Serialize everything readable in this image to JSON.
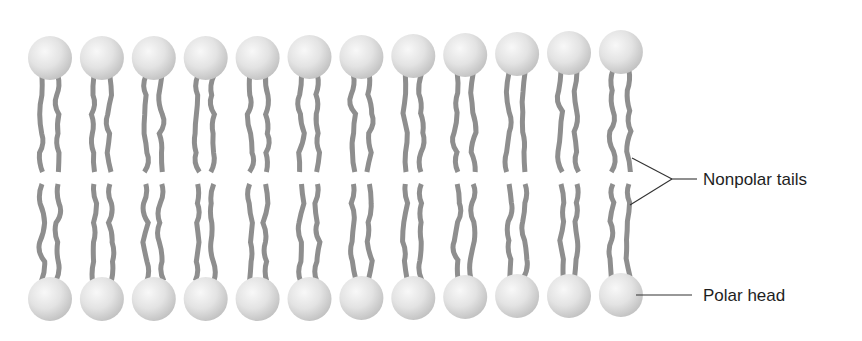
{
  "labels": {
    "tails": "Nonpolar tails",
    "head": "Polar head"
  },
  "colors": {
    "background": "#ffffff",
    "head_light": "#f6f6f6",
    "head_mid": "#e0e0e0",
    "head_edge": "#c4c4c4",
    "tail": "#8e8e8e",
    "leader_line": "#333333",
    "label_text": "#1e1e1e"
  },
  "layout": {
    "molecule_count_per_leaflet": 12,
    "first_center_x": 50,
    "spacing_x": 51.9,
    "head_radius": 22,
    "top_head_y": [
      58,
      58,
      58,
      58,
      58,
      57,
      57,
      56,
      55,
      54,
      53,
      52
    ],
    "bottom_head_y": [
      299,
      299,
      299,
      299,
      299,
      299,
      298,
      298,
      297,
      296,
      296,
      295
    ],
    "top_tail_end_y": 172,
    "bottom_tail_start_y": 184,
    "tail_width": 5,
    "tail_offset_x": 8
  },
  "leaders": {
    "tails": {
      "upper_start": [
        632,
        158
      ],
      "lower_start": [
        630,
        205
      ],
      "apex": [
        672,
        179
      ],
      "end": [
        697,
        179
      ]
    },
    "head": {
      "start": [
        636,
        295
      ],
      "end": [
        692,
        295
      ]
    }
  }
}
